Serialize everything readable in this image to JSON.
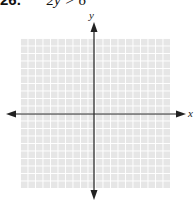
{
  "problem": {
    "number": "26.",
    "equation": "2y > 6"
  },
  "graph": {
    "x_label": "x",
    "y_label": "y",
    "grid_cells": 20,
    "grid_color": "#e6e6e6",
    "axis_color": "#222222"
  }
}
